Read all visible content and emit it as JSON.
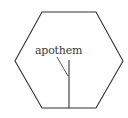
{
  "diagram": {
    "shape": "regular-hexagon",
    "label": "apothem",
    "stroke_color": "#333333",
    "label_color": "#3a3a3a",
    "hexagon_points": "42,12 96,12 123,61 96,108 42,108 15,61",
    "apothem_line": {
      "x1": 69,
      "y1": 60,
      "x2": 69,
      "y2": 108
    },
    "leader_line": {
      "x1": 57,
      "y1": 57,
      "x2": 68,
      "y2": 76
    }
  }
}
